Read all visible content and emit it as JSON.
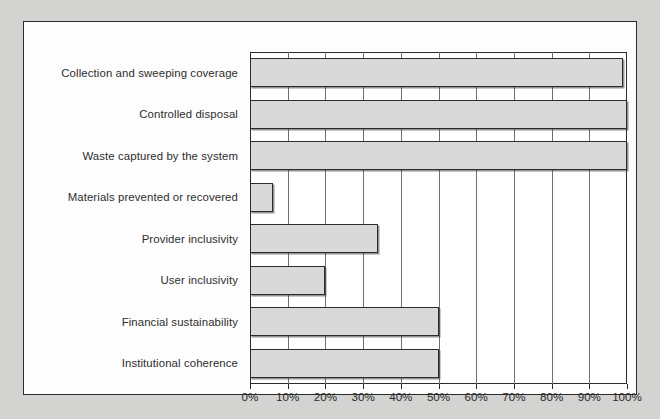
{
  "chart_data": {
    "type": "bar",
    "orientation": "horizontal",
    "title": "",
    "xlabel": "",
    "ylabel": "",
    "xlim": [
      0,
      100
    ],
    "xtick_labels": [
      "0%",
      "10%",
      "20%",
      "30%",
      "40%",
      "50%",
      "60%",
      "70%",
      "80%",
      "90%",
      "100%"
    ],
    "xtick_values": [
      0,
      10,
      20,
      30,
      40,
      50,
      60,
      70,
      80,
      90,
      100
    ],
    "grid": true,
    "legend": "none",
    "categories": [
      "Collection and sweeping coverage",
      "Controlled disposal",
      "Waste captured by the system",
      "Materials prevented or recovered",
      "Provider inclusivity",
      "User inclusivity",
      "Financial sustainability",
      "Institutional coherence"
    ],
    "values": [
      99,
      100,
      100,
      6,
      34,
      20,
      50,
      50
    ],
    "value_labels": [
      "99%",
      "100%",
      "100%",
      "6%",
      "34%",
      "20%",
      "50%",
      "50%"
    ],
    "bar_fill_color": "#d9d9d9",
    "bar_border_color": "#2b2b2b",
    "plot_background_color": "#ffffff",
    "panel_background_color": "#fdfdfd",
    "page_background_color": "#d3d3d2",
    "gridline_color": "#6f6f6f"
  }
}
